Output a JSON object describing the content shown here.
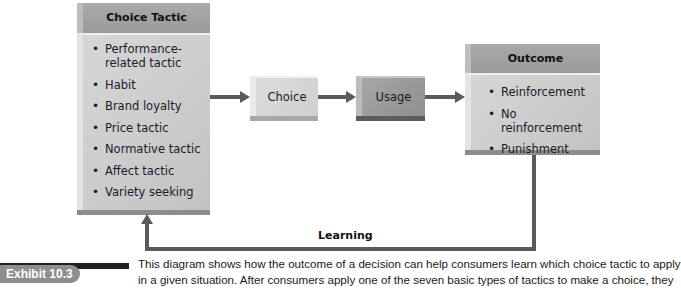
{
  "diagram": {
    "choice_tactic": {
      "title": "Choice Tactic",
      "items": [
        "Performance-related tactic",
        "Habit",
        "Brand loyalty",
        "Price tactic",
        "Normative tactic",
        "Affect tactic",
        "Variety seeking"
      ]
    },
    "choice": {
      "label": "Choice"
    },
    "usage": {
      "label": "Usage"
    },
    "outcome": {
      "title": "Outcome",
      "items": [
        "Reinforcement",
        "No reinforcement",
        "Punishment"
      ]
    },
    "feedback": {
      "label": "Learning"
    }
  },
  "exhibit": {
    "label": "Exhibit 10.3",
    "caption_line1": "This diagram shows how the outcome of a decision can help consumers learn which choice tactic to apply",
    "caption_line2": "in a given situation. After consumers apply one of the seven basic types of tactics to make a choice, they"
  },
  "colors": {
    "header_gray": "#9a9a9a",
    "body_gray": "#cfcfcf",
    "usage_gray": "#969696",
    "arrow": "#5a5a5a",
    "exhibit_bar": "#1f1f1f",
    "exhibit_pill": "#8e8e8e"
  }
}
